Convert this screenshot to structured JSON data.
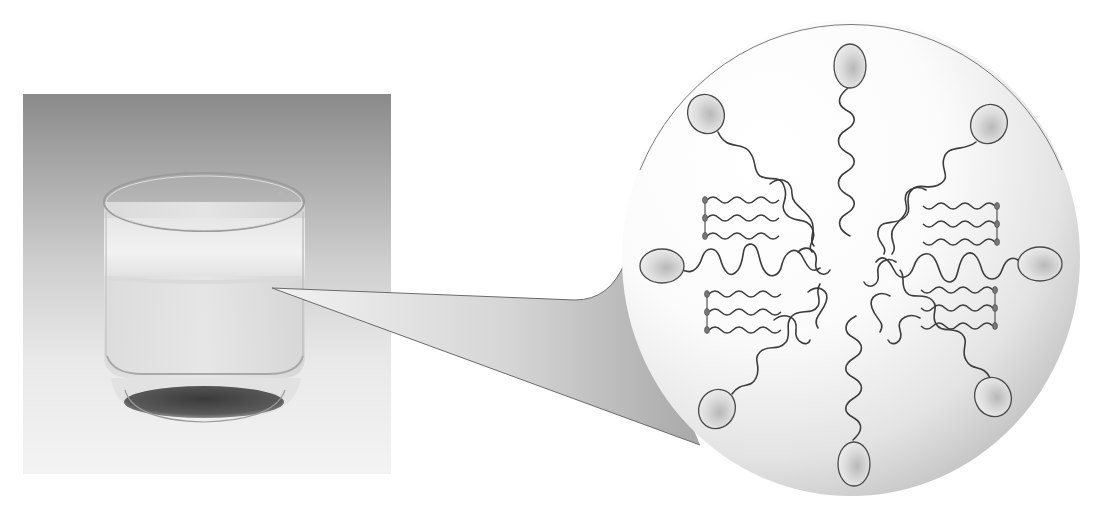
{
  "figure": {
    "photo": {
      "subject": "glass-with-oil-water-emulsion",
      "layers": [
        "cloudy emulsion layer",
        "clear liquid layer",
        "dark sediment at base"
      ]
    },
    "callout": {
      "from": "emulsion-layer",
      "to": "micelle-magnification"
    },
    "micelle": {
      "head_groups": 8,
      "triglyceride_clusters": 4,
      "colors": {
        "head_fill": "#d4d4d4",
        "outline": "#4a4a4a",
        "circle_bg_light": "#ffffff",
        "circle_bg_dark": "#b8b8b8"
      }
    },
    "caption_cropped": ""
  }
}
